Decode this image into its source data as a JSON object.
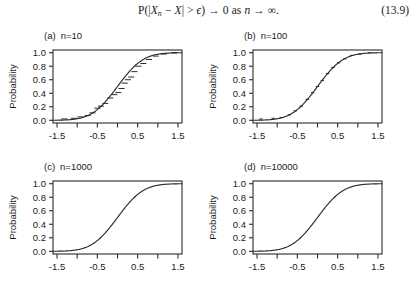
{
  "equation": {
    "number": "(13.9)",
    "text": "P(|X_n - X| > ϵ) → 0 as n → ∞.",
    "lhs_p": "P(|",
    "var_x": "X",
    "var_n": "n",
    "minus": " − ",
    "var_x2": "X",
    "gt": "| > ",
    "eps": "ϵ",
    "to_zero": ") → 0 as ",
    "var_n2": "n",
    "to_inf": " → ∞."
  },
  "chart_data": {
    "type": "line",
    "title": "",
    "xlabel": "",
    "ylabel": "Probability",
    "xlim": [
      -1.6,
      1.6
    ],
    "ylim": [
      -0.04,
      1.04
    ],
    "grid": false,
    "legend": "none",
    "x_major_ticks": [
      -1.5,
      -0.5,
      0.5,
      1.5
    ],
    "x_major_tick_labels": [
      "-1.5",
      "-0.5",
      "0.5",
      "1.5"
    ],
    "x_minor_ticks": [
      -1.0,
      0.0,
      1.0
    ],
    "y_ticks": [
      0.0,
      0.2,
      0.4,
      0.6,
      0.8,
      1.0
    ],
    "y_tick_labels": [
      "0.0",
      "0.2",
      "0.4",
      "0.6",
      "0.8",
      "1.0"
    ],
    "curve_description": "normal CDF with mean 0 and sd 0.5",
    "curve_mean": 0.0,
    "curve_sd": 0.5,
    "panels": [
      {
        "tag": "(a)",
        "n_label": "n=10",
        "n": 10,
        "has_empirical_steps": true,
        "empirical_x": [
          -1.32,
          -1.08,
          -0.92,
          -0.74,
          -0.62,
          -0.5,
          -0.41,
          -0.3,
          -0.18,
          -0.08,
          0.02,
          0.1,
          0.18,
          0.26,
          0.34,
          0.42,
          0.52,
          0.64,
          0.78,
          0.95,
          1.15,
          1.4
        ],
        "empirical_y": [
          0.02,
          0.03,
          0.05,
          0.07,
          0.11,
          0.18,
          0.21,
          0.25,
          0.33,
          0.38,
          0.41,
          0.47,
          0.55,
          0.6,
          0.64,
          0.72,
          0.8,
          0.84,
          0.9,
          0.95,
          0.98,
          1.0
        ]
      },
      {
        "tag": "(b)",
        "n_label": "n=100",
        "n": 100,
        "has_empirical_steps": true,
        "empirical_x": [
          -1.4,
          -1.1,
          -0.9,
          -0.7,
          -0.55,
          -0.4,
          -0.25,
          -0.12,
          0.0,
          0.12,
          0.25,
          0.38,
          0.52,
          0.68,
          0.85,
          1.05,
          1.3
        ],
        "empirical_y": [
          0.02,
          0.03,
          0.04,
          0.08,
          0.14,
          0.21,
          0.31,
          0.41,
          0.5,
          0.59,
          0.69,
          0.78,
          0.85,
          0.91,
          0.96,
          0.98,
          1.0
        ]
      },
      {
        "tag": "(c)",
        "n_label": "n=1000",
        "n": 1000,
        "has_empirical_steps": false,
        "empirical_x": [],
        "empirical_y": []
      },
      {
        "tag": "(d)",
        "n_label": "n=10000",
        "n": 10000,
        "has_empirical_steps": false,
        "empirical_x": [],
        "empirical_y": []
      }
    ]
  },
  "colors": {
    "background": "#ffffff",
    "ink": "#1a1a1a",
    "curve": "#2b2b2b",
    "frame": "#2b2b2b"
  }
}
